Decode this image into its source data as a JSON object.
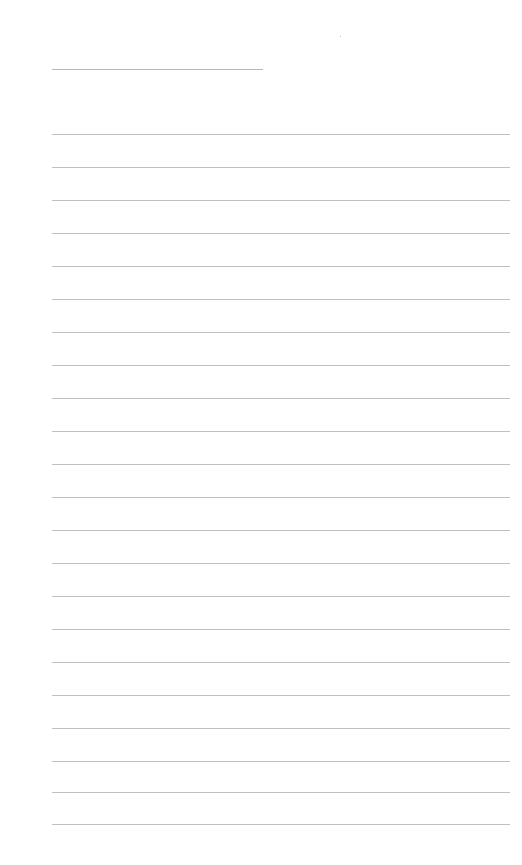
{
  "document": {
    "type": "lined-paper",
    "title_line": {
      "label": ""
    },
    "rule_count": 22,
    "rule_color": "#c0c0c0",
    "title_line_color": "#b8b8b8",
    "background_color": "#ffffff",
    "rules": [
      {
        "top": 134
      },
      {
        "top": 167
      },
      {
        "top": 200
      },
      {
        "top": 233
      },
      {
        "top": 266
      },
      {
        "top": 299
      },
      {
        "top": 332
      },
      {
        "top": 365
      },
      {
        "top": 398
      },
      {
        "top": 431
      },
      {
        "top": 464
      },
      {
        "top": 497
      },
      {
        "top": 530
      },
      {
        "top": 563
      },
      {
        "top": 596
      },
      {
        "top": 629
      },
      {
        "top": 662
      },
      {
        "top": 695
      },
      {
        "top": 728
      },
      {
        "top": 761
      },
      {
        "top": 792
      },
      {
        "top": 824
      }
    ]
  }
}
